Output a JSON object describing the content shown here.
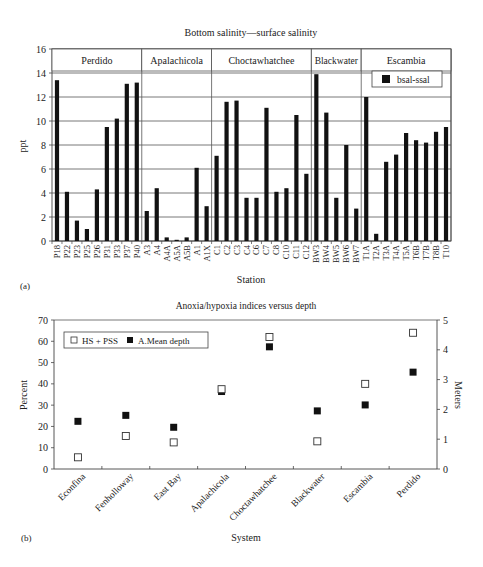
{
  "chart_data": [
    {
      "panel_label": "(a)",
      "type": "bar",
      "title": "Bottom salinity—surface salinity",
      "xlabel": "Station",
      "ylabel": "ppt",
      "ylim": [
        0,
        16
      ],
      "yticks": [
        0,
        2,
        4,
        6,
        8,
        10,
        12,
        14,
        16
      ],
      "grid": true,
      "legend": {
        "position": "upper-right (inside Escambia section)",
        "entries": [
          "bsal-ssal"
        ]
      },
      "groups": [
        {
          "name": "Perdido",
          "stations": [
            "P18",
            "P22",
            "P23",
            "P25",
            "P26",
            "P31",
            "P33",
            "P37",
            "P40"
          ]
        },
        {
          "name": "Apalachicola",
          "stations": [
            "A3",
            "A4",
            "A4A",
            "A5A",
            "A5B",
            "A1",
            "A1X"
          ]
        },
        {
          "name": "Choctawhatchee",
          "stations": [
            "C1",
            "C2",
            "C3",
            "C4",
            "C6",
            "C7",
            "C8",
            "C10",
            "C11",
            "C12"
          ]
        },
        {
          "name": "Blackwater",
          "stations": [
            "BW3",
            "BW4",
            "BW5",
            "BW6",
            "BW7"
          ]
        },
        {
          "name": "Escambia",
          "stations": [
            "T1A",
            "T2A",
            "T3A",
            "T4A",
            "T5A",
            "T6B",
            "T7B",
            "T8B",
            "T10"
          ]
        }
      ],
      "categories": [
        "P18",
        "P22",
        "P23",
        "P25",
        "P26",
        "P31",
        "P33",
        "P37",
        "P40",
        "A3",
        "A4",
        "A4A",
        "A5A",
        "A5B",
        "A1",
        "A1X",
        "C1",
        "C2",
        "C3",
        "C4",
        "C6",
        "C7",
        "C8",
        "C10",
        "C11",
        "C12",
        "BW3",
        "BW4",
        "BW5",
        "BW6",
        "BW7",
        "T1A",
        "T2A",
        "T3A",
        "T4A",
        "T5A",
        "T6B",
        "T7B",
        "T8B",
        "T10"
      ],
      "series": [
        {
          "name": "bsal-ssal",
          "color": "#111111",
          "values": [
            13.4,
            4.1,
            1.7,
            1.0,
            4.3,
            9.5,
            10.2,
            13.1,
            13.2,
            2.5,
            4.4,
            0.3,
            0.1,
            0.3,
            6.1,
            2.9,
            7.1,
            11.6,
            11.7,
            3.6,
            3.6,
            11.1,
            4.1,
            4.4,
            10.5,
            5.6,
            13.9,
            10.7,
            3.6,
            8.0,
            2.7,
            12.0,
            0.6,
            6.6,
            7.2,
            9.0,
            8.4,
            8.2,
            9.1,
            9.5
          ]
        }
      ]
    },
    {
      "panel_label": "(b)",
      "type": "scatter",
      "title": "Anoxia/hypoxia indices versus depth",
      "xlabel": "System",
      "ylabel": "Percent",
      "ylabel_right": "Meters",
      "ylim": [
        0,
        70
      ],
      "yticks": [
        0,
        10,
        20,
        30,
        40,
        50,
        60,
        70
      ],
      "ylim_right": [
        0,
        5
      ],
      "yticks_right": [
        0,
        1,
        2,
        3,
        4,
        5
      ],
      "grid": false,
      "legend": {
        "position": "upper-left",
        "entries": [
          "HS + PSS",
          "A.Mean depth"
        ]
      },
      "categories": [
        "Econfina",
        "Fenholloway",
        "East Bay",
        "Apalachicola",
        "Choctawhatchee",
        "Blackwater",
        "Escambia",
        "Perdido"
      ],
      "series": [
        {
          "name": "HS + PSS",
          "axis": "left",
          "marker": "open-square",
          "values": [
            5.5,
            15.5,
            12.5,
            37.5,
            62,
            13,
            40,
            64
          ]
        },
        {
          "name": "A.Mean depth",
          "axis": "right",
          "marker": "filled-square",
          "values": [
            1.6,
            1.8,
            1.4,
            2.6,
            4.1,
            1.95,
            2.15,
            3.25
          ]
        }
      ]
    }
  ]
}
